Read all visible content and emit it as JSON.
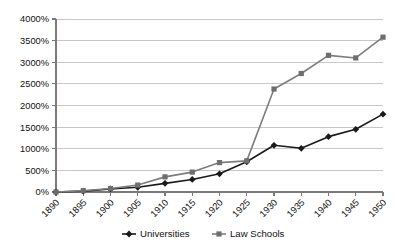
{
  "chart_data": {
    "type": "line",
    "title": "",
    "subtitle": "",
    "xlabel": "",
    "ylabel": "",
    "categories": [
      "1890",
      "1895",
      "1900",
      "1905",
      "1910",
      "1915",
      "1920",
      "1925",
      "1930",
      "1935",
      "1940",
      "1945",
      "1950"
    ],
    "ylim": [
      0,
      4000
    ],
    "ytick_values": [
      0,
      500,
      1000,
      1500,
      2000,
      2500,
      3000,
      3500,
      4000
    ],
    "ytick_labels": [
      "0%",
      "500%",
      "1000%",
      "1500%",
      "2000%",
      "2500%",
      "3000%",
      "3500%",
      "4000%"
    ],
    "grid": true,
    "legend_position": "bottom",
    "series": [
      {
        "name": "Universities",
        "marker": "diamond",
        "color": "#1a1a1a",
        "values": [
          0,
          20,
          70,
          110,
          200,
          290,
          420,
          700,
          1080,
          1010,
          1280,
          1450,
          1800
        ]
      },
      {
        "name": "Law Schools",
        "marker": "square",
        "color": "#6e6e6e",
        "values": [
          0,
          30,
          80,
          160,
          350,
          460,
          680,
          720,
          2380,
          2740,
          3160,
          3100,
          3580
        ]
      }
    ]
  },
  "legend": {
    "items": [
      {
        "label": "Universities"
      },
      {
        "label": "Law Schools"
      }
    ]
  }
}
